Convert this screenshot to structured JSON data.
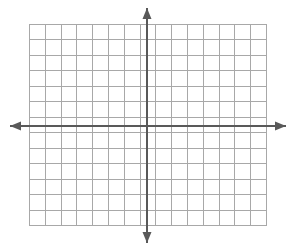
{
  "figure": {
    "title": "",
    "width": 295,
    "height": 251,
    "background_color": "#ffffff"
  },
  "chart_data": {
    "type": "scatter",
    "title": "",
    "subtitle": "",
    "xlabel": "",
    "ylabel": "",
    "series": [],
    "x": [],
    "values": [],
    "categories": [],
    "grid": true,
    "legend": "none",
    "annotations": [],
    "xlim": [
      -8,
      7
    ],
    "ylim": [
      -6,
      7
    ],
    "xticks": [],
    "yticks": [],
    "tick_labels_visible": false,
    "grid_columns": 15,
    "grid_rows": 13,
    "cell_width": 15.8,
    "cell_height": 15.5,
    "origin_column_index": 7,
    "origin_row_index": 6
  },
  "grid": {
    "left": 29,
    "top": 24,
    "right": 266,
    "bottom": 225,
    "columns": 15,
    "rows": 13,
    "line_color": "#a8a8a8",
    "line_width": 1,
    "border_color": "#a8a8a8",
    "fill_color": "#ffffff"
  },
  "axes": {
    "color": "#595959",
    "line_width": 2,
    "origin_x": 147,
    "origin_y": 126,
    "x_axis": {
      "name": "x-axis",
      "start_x": 10,
      "end_x": 286,
      "y": 126,
      "arrow_left": true,
      "arrow_right": true,
      "label": ""
    },
    "y_axis": {
      "name": "y-axis",
      "x": 147,
      "start_y": 8,
      "end_y": 243,
      "arrow_up": true,
      "arrow_down": true,
      "label": ""
    },
    "arrow_size": {
      "length": 11,
      "half_width": 4.5
    }
  }
}
